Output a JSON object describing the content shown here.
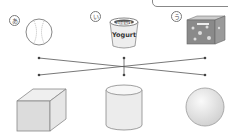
{
  "worksheet": {
    "items": [
      {
        "label": "あ",
        "name": "baseball"
      },
      {
        "label": "い",
        "name": "yogurt",
        "text_top": "yogurt",
        "text_body": "Yogurt"
      },
      {
        "label": "う",
        "name": "cereal-box"
      }
    ],
    "shapes": [
      "cube",
      "cylinder",
      "sphere"
    ],
    "connections": [
      {
        "from": "baseball",
        "to": "sphere"
      },
      {
        "from": "yogurt",
        "to": "cylinder"
      },
      {
        "from": "cereal-box",
        "to": "cube"
      }
    ],
    "colors": {
      "line": "#555555",
      "shape_fill": "#e4e4e4",
      "outline": "#888888"
    }
  }
}
